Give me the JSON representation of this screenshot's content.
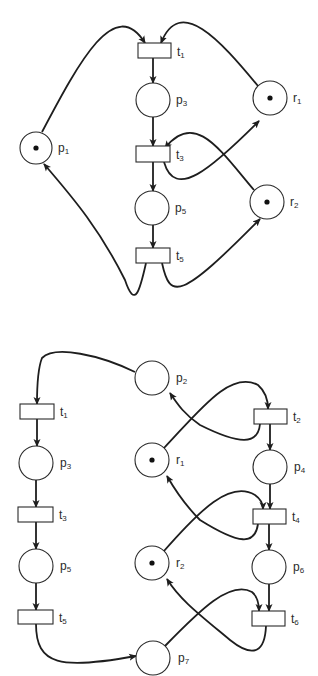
{
  "colors": {
    "stroke": "#1e1e1e",
    "fill": "#ffffff",
    "token": "#111111",
    "label": "#2a2a2a"
  },
  "diagrams": [
    {
      "name": "petri-net-top",
      "places": [
        {
          "id": "p1",
          "base": "p",
          "sub": "1",
          "cx": 36,
          "cy": 148,
          "r": 16,
          "tokens": 1,
          "label_x": 58,
          "label_y": 152
        },
        {
          "id": "p3",
          "base": "p",
          "sub": "3",
          "cx": 153,
          "cy": 100,
          "r": 17,
          "tokens": 0,
          "label_x": 176,
          "label_y": 104
        },
        {
          "id": "p5",
          "base": "p",
          "sub": "5",
          "cx": 152,
          "cy": 208,
          "r": 17,
          "tokens": 0,
          "label_x": 175,
          "label_y": 212
        },
        {
          "id": "r1",
          "base": "r",
          "sub": "1",
          "cx": 270,
          "cy": 98,
          "r": 17,
          "tokens": 1,
          "label_x": 293,
          "label_y": 102
        },
        {
          "id": "r2",
          "base": "r",
          "sub": "2",
          "cx": 267,
          "cy": 202,
          "r": 17,
          "tokens": 1,
          "label_x": 290,
          "label_y": 206
        }
      ],
      "transitions": [
        {
          "id": "t1",
          "base": "t",
          "sub": "1",
          "x": 138,
          "y": 43,
          "w": 33,
          "h": 15,
          "label_x": 177,
          "label_y": 56
        },
        {
          "id": "t3",
          "base": "t",
          "sub": "3",
          "x": 136,
          "y": 146,
          "w": 34,
          "h": 16,
          "label_x": 176,
          "label_y": 159
        },
        {
          "id": "t5",
          "base": "t",
          "sub": "5",
          "x": 136,
          "y": 248,
          "w": 34,
          "h": 15,
          "label_x": 176,
          "label_y": 260
        }
      ],
      "arcs": [
        {
          "d": "M42,132 C80,60 115,-5 145,43",
          "arrow": true
        },
        {
          "d": "M258,86 C220,40 180,-5 161,43",
          "arrow": true
        },
        {
          "d": "M153,58 L153,83",
          "arrow": true
        },
        {
          "d": "M153,117 L153,146",
          "arrow": true
        },
        {
          "d": "M153,162 L153,191",
          "arrow": true
        },
        {
          "d": "M153,225 L153,248",
          "arrow": true
        },
        {
          "d": "M164,162 C175,200 210,170 259,121",
          "arrow": true
        },
        {
          "d": "M254,190 C220,150 195,110 165,148",
          "arrow": true
        },
        {
          "d": "M146,263 C140,290 135,310 125,280 C100,230 75,200 44,164",
          "arrow": true
        },
        {
          "d": "M162,263 C170,300 180,300 260,219",
          "arrow": true
        }
      ]
    },
    {
      "name": "petri-net-bottom",
      "places": [
        {
          "id": "p2",
          "base": "p",
          "sub": "2",
          "cx": 152,
          "cy": 378,
          "r": 17,
          "tokens": 0,
          "label_x": 176,
          "label_y": 382
        },
        {
          "id": "p3",
          "base": "p",
          "sub": "3",
          "cx": 36,
          "cy": 463,
          "r": 17,
          "tokens": 0,
          "label_x": 60,
          "label_y": 467
        },
        {
          "id": "r1",
          "base": "r",
          "sub": "1",
          "cx": 152,
          "cy": 460,
          "r": 17,
          "tokens": 1,
          "label_x": 176,
          "label_y": 464
        },
        {
          "id": "p4",
          "base": "p",
          "sub": "4",
          "cx": 270,
          "cy": 467,
          "r": 17,
          "tokens": 0,
          "label_x": 294,
          "label_y": 471
        },
        {
          "id": "p5",
          "base": "p",
          "sub": "5",
          "cx": 36,
          "cy": 566,
          "r": 17,
          "tokens": 0,
          "label_x": 60,
          "label_y": 570
        },
        {
          "id": "r2",
          "base": "r",
          "sub": "2",
          "cx": 152,
          "cy": 563,
          "r": 17,
          "tokens": 1,
          "label_x": 176,
          "label_y": 567
        },
        {
          "id": "p6",
          "base": "p",
          "sub": "6",
          "cx": 269,
          "cy": 567,
          "r": 17,
          "tokens": 0,
          "label_x": 293,
          "label_y": 571
        },
        {
          "id": "p7",
          "base": "p",
          "sub": "7",
          "cx": 153,
          "cy": 658,
          "r": 17,
          "tokens": 0,
          "label_x": 178,
          "label_y": 662
        }
      ],
      "transitions": [
        {
          "id": "t1",
          "base": "t",
          "sub": "1",
          "x": 20,
          "y": 404,
          "w": 34,
          "h": 15,
          "label_x": 60,
          "label_y": 416
        },
        {
          "id": "t2",
          "base": "t",
          "sub": "2",
          "x": 254,
          "y": 409,
          "w": 33,
          "h": 15,
          "label_x": 293,
          "label_y": 421
        },
        {
          "id": "t3",
          "base": "t",
          "sub": "3",
          "x": 18,
          "y": 507,
          "w": 35,
          "h": 15,
          "label_x": 59,
          "label_y": 519
        },
        {
          "id": "t4",
          "base": "t",
          "sub": "4",
          "x": 253,
          "y": 509,
          "w": 33,
          "h": 15,
          "label_x": 292,
          "label_y": 521
        },
        {
          "id": "t5",
          "base": "t",
          "sub": "5",
          "x": 18,
          "y": 610,
          "w": 35,
          "h": 14,
          "label_x": 59,
          "label_y": 622
        },
        {
          "id": "t6",
          "base": "t",
          "sub": "6",
          "x": 252,
          "y": 611,
          "w": 33,
          "h": 15,
          "label_x": 291,
          "label_y": 623
        }
      ],
      "arcs": [
        {
          "d": "M135,372 C100,355 55,345 42,358 C38,368 37,385 37,404",
          "arrow": true
        },
        {
          "d": "M37,419 L37,446",
          "arrow": true
        },
        {
          "d": "M36,480 L36,507",
          "arrow": true
        },
        {
          "d": "M36,522 L36,549",
          "arrow": true
        },
        {
          "d": "M36,583 L36,610",
          "arrow": true
        },
        {
          "d": "M36,624 C36,665 60,670 136,656",
          "arrow": true
        },
        {
          "d": "M164,448 C200,410 230,370 258,385 C266,392 268,400 268,409",
          "arrow": true
        },
        {
          "d": "M260,424 C258,445 240,445 200,425 C185,415 178,405 170,393",
          "arrow": true
        },
        {
          "d": "M270,424 L270,450",
          "arrow": true
        },
        {
          "d": "M270,484 L270,509",
          "arrow": true
        },
        {
          "d": "M164,551 C200,510 230,480 255,495 C262,500 263,505 263,509",
          "arrow": true
        },
        {
          "d": "M258,524 C255,545 240,545 200,520 C185,505 175,490 167,476",
          "arrow": true
        },
        {
          "d": "M269,524 L269,550",
          "arrow": true
        },
        {
          "d": "M269,584 L269,611",
          "arrow": true
        },
        {
          "d": "M165,646 C200,610 230,580 252,592 C258,597 259,604 259,611",
          "arrow": true
        },
        {
          "d": "M266,626 C265,650 255,660 230,640 C200,615 180,600 167,579",
          "arrow": true
        }
      ]
    }
  ]
}
